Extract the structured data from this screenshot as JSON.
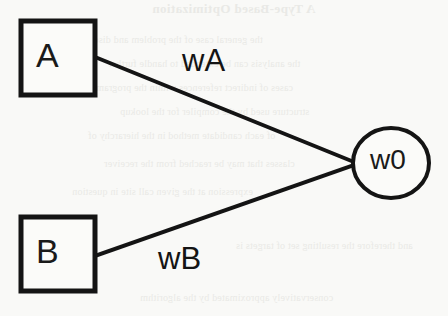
{
  "diagram": {
    "background_color": "#f9f9f7",
    "ink_color": "#141414",
    "nodes": [
      {
        "id": "A",
        "label": "A",
        "shape": "square",
        "x": 21,
        "y": 21,
        "width": 74,
        "height": 74
      },
      {
        "id": "B",
        "label": "B",
        "shape": "square",
        "x": 21,
        "y": 217,
        "width": 74,
        "height": 74
      },
      {
        "id": "w0",
        "label": "w0",
        "shape": "circle",
        "cx": 391,
        "cy": 163,
        "rx": 38,
        "ry": 35
      }
    ],
    "edges": [
      {
        "id": "edge-A-w0",
        "label": "wA",
        "from": "A",
        "to": "w0",
        "x1": 95,
        "y1": 57,
        "x2": 354,
        "y2": 162
      },
      {
        "id": "edge-B-w0",
        "label": "wB",
        "from": "B",
        "to": "w0",
        "x1": 95,
        "y1": 256,
        "x2": 354,
        "y2": 165
      }
    ]
  },
  "bleed_through": {
    "title": "A Type-Based Optimization",
    "lines": [
      "the general case of the problem and discuss how",
      "the analysis can be extended to handle further",
      "cases of indirect references within the program",
      "structure used by the compiler for the lookup",
      "of each candidate method in the hierarchy of",
      "classes that may be reached from the receiver",
      "expression at the given call site in question",
      "and therefore the resulting set of targets is",
      "conservatively approximated by the algorithm"
    ]
  }
}
